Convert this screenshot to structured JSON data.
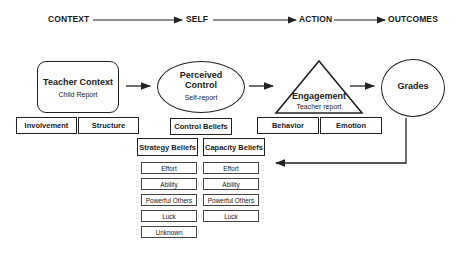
{
  "stages": [
    "CONTEXT",
    "SELF",
    "ACTION",
    "OUTCOMES"
  ],
  "nodes": {
    "context": {
      "title": "Teacher Context",
      "subtitle": "Child Report",
      "components": [
        "Involvement",
        "Structure"
      ]
    },
    "self": {
      "title_line1": "Perceived",
      "title_line2": "Control",
      "subtitle": "Self-report",
      "component": "Control Beliefs"
    },
    "action": {
      "title": "Engagement",
      "subtitle": "Teacher report",
      "components": [
        "Behavior",
        "Emotion"
      ]
    },
    "outcome": {
      "title": "Grades"
    }
  },
  "beliefs": {
    "strategy": {
      "header": "Strategy Beliefs",
      "items": [
        "Effort",
        "Ability",
        "Powerful Others",
        "Luck",
        "Unknown"
      ]
    },
    "capacity": {
      "header": "Capacity Beliefs",
      "items": [
        "Effort",
        "Ability",
        "Powerful Others",
        "Luck"
      ]
    }
  },
  "colors": {
    "line": "#222222",
    "background": "#ffffff"
  }
}
